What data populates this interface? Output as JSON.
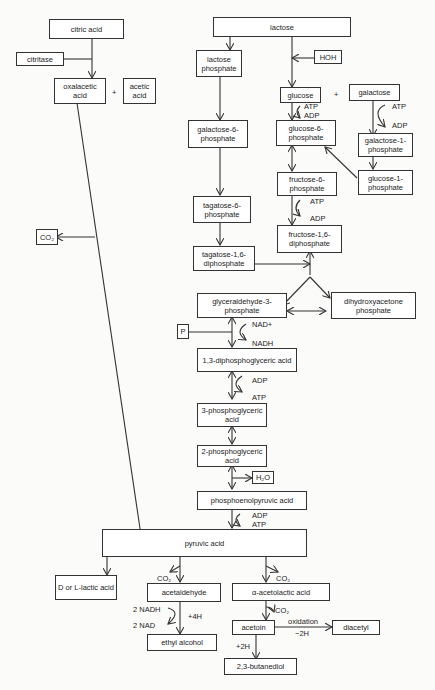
{
  "diagram": {
    "type": "metabolic-pathway",
    "nodes": {
      "citric_acid": "citric acid",
      "citritase": "citritase",
      "oxalacetic_acid": "oxalacetic acid",
      "acetic_acid": "acetic acid",
      "co2_left": "CO₂",
      "lactose": "lactose",
      "hoh": "HOH",
      "lactose_phosphate": "lactose phosphate",
      "glucose": "glucose",
      "galactose": "galactose",
      "galactose_6_phosphate": "galactose-6-phosphate",
      "glucose_6_phosphate": "glucose-6-phosphate",
      "galactose_1_phosphate": "galactose-1-phosphate",
      "glucose_1_phosphate": "glucose-1-phosphate",
      "fructose_6_phosphate": "fructose-6-phosphate",
      "tagatose_6_phosphate": "tagatose-6-phosphate",
      "fructose_1_6_diphosphate": "fructose-1,6-diphosphate",
      "tagatose_1_6_diphosphate": "tagatose-1,6-diphosphate",
      "glyceraldehyde_3_phosphate": "glyceraldehyde-3-phosphate",
      "dihydroxyacetone_phosphate": "dihydroxyacetone phosphate",
      "p": "P",
      "diphosphoglyceric_acid": "1,3-diphosphoglyceric acid",
      "phosphoglyceric_3": "3-phosphoglyceric acid",
      "phosphoglyceric_2": "2-phosphoglyceric acid",
      "h2o": "H₂O",
      "pep": "phosphoenolpyruvic acid",
      "pyruvic_acid": "pyruvic acid",
      "lactic_acid": "D or L-lactic acid",
      "acetaldehyde": "acetaldehyde",
      "acetolactic_acid": "α-acetolactic acid",
      "ethyl_alcohol": "ethyl alcohol",
      "acetoin": "acetoin",
      "diacetyl": "diacetyl",
      "butanediol": "2,3-butanediol"
    },
    "labels": {
      "plus1": "+",
      "plus2": "+",
      "atp1": "ATP",
      "adp1": "ADP",
      "atp2": "ATP",
      "adp2": "ADP",
      "atp3": "ATP",
      "adp3": "ADP",
      "nad_plus": "NAD+",
      "nadh": "NADH",
      "adp4": "ADP",
      "atp4": "ATP",
      "adp5": "ADP",
      "atp5": "ATP",
      "co2_a": "CO₂",
      "co2_b": "CO₂",
      "co2_c": "CO₂",
      "nadh2": "2 NADH",
      "nad2": "2 NAD",
      "plus4h": "+4H",
      "oxidation": "oxidation",
      "minus2h": "−2H",
      "plus2h": "+2H"
    }
  }
}
